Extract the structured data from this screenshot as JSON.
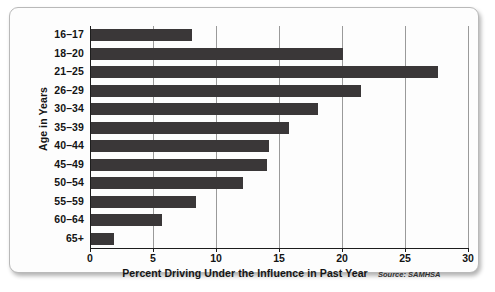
{
  "chart_data": {
    "type": "bar",
    "orientation": "horizontal",
    "title": "",
    "xlabel": "Percent Driving Under the Influence in Past Year",
    "ylabel": "Age in Years",
    "source": "Source: SAMHSA",
    "xlim": [
      0,
      30
    ],
    "xticks": [
      0,
      5,
      10,
      15,
      20,
      25,
      30
    ],
    "xtick_labels": [
      "0",
      "5",
      "10",
      "15",
      "20",
      "25",
      "30"
    ],
    "grid": true,
    "grid_axis": "x",
    "legend": false,
    "bar_color": "#3a3738",
    "categories": [
      "16–17",
      "18–20",
      "21–25",
      "26–29",
      "30–34",
      "35–39",
      "40–44",
      "45–49",
      "50–54",
      "55–59",
      "60–64",
      "65+"
    ],
    "values": [
      8.0,
      20.0,
      27.5,
      21.4,
      18.0,
      15.7,
      14.1,
      14.0,
      12.1,
      8.3,
      5.6,
      1.8
    ]
  }
}
